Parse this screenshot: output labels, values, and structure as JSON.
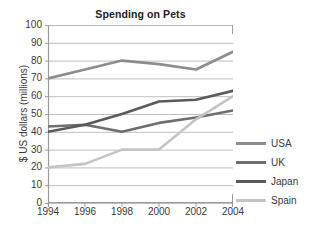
{
  "chart_data": {
    "type": "line",
    "title": "Spending on Pets",
    "xlabel": "",
    "ylabel": "$ US dollars (millions)",
    "x": [
      1994,
      1996,
      1998,
      2000,
      2002,
      2004
    ],
    "xtick_labels": [
      "1994",
      "1996",
      "1998",
      "2000",
      "2002",
      "2004"
    ],
    "xlim": [
      1994,
      2004
    ],
    "ylim": [
      0,
      100
    ],
    "ytick_labels": [
      "0",
      "10",
      "20",
      "30",
      "40",
      "50",
      "60",
      "70",
      "80",
      "90",
      "100"
    ],
    "ytick_values": [
      0,
      10,
      20,
      30,
      40,
      50,
      60,
      70,
      80,
      90,
      100
    ],
    "grid": "horizontal",
    "legend_position": "right",
    "series": [
      {
        "name": "USA",
        "color": "#8c8c8c",
        "values": [
          70,
          75,
          80,
          78,
          75,
          85
        ]
      },
      {
        "name": "UK",
        "color": "#6e6e6e",
        "values": [
          43,
          44,
          40,
          45,
          48,
          52
        ]
      },
      {
        "name": "Japan",
        "color": "#5a5a5a",
        "values": [
          40,
          44,
          50,
          57,
          58,
          63
        ]
      },
      {
        "name": "Spain",
        "color": "#c4c4c4",
        "values": [
          20,
          22,
          30,
          30,
          47,
          60
        ]
      }
    ],
    "axis_color": "#9a9a9a",
    "grid_color": "#b8b8b8"
  },
  "legend": {
    "items": [
      {
        "label": "USA"
      },
      {
        "label": "UK"
      },
      {
        "label": "Japan"
      },
      {
        "label": "Spain"
      }
    ]
  }
}
